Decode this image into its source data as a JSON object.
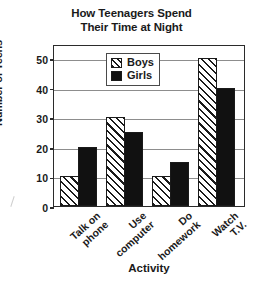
{
  "chart_data": {
    "type": "bar",
    "title": "How Teenagers Spend Their Time at Night",
    "title_lines": [
      "How Teenagers Spend",
      "Their Time at Night"
    ],
    "xlabel": "Activity",
    "ylabel": "Number of Teens",
    "categories": [
      "Talk on phone",
      "Use computer",
      "Do homework",
      "Watch T.V."
    ],
    "category_lines": [
      [
        "Talk on",
        "phone"
      ],
      [
        "Use",
        "computer"
      ],
      [
        "Do",
        "homework"
      ],
      [
        "Watch",
        "T.V."
      ]
    ],
    "series": [
      {
        "name": "Boys",
        "values": [
          10,
          30,
          10,
          50
        ],
        "fill": "diagonal-hatch"
      },
      {
        "name": "Girls",
        "values": [
          20,
          25,
          15,
          40
        ],
        "fill": "solid-black"
      }
    ],
    "ylim": [
      0,
      50
    ],
    "yticks": [
      0,
      10,
      20,
      30,
      40,
      50
    ],
    "ytick_labels": [
      "0",
      "10",
      "20",
      "30",
      "40",
      "50"
    ],
    "grid": true,
    "grid_axis": "y",
    "legend_position": "top-center-inside",
    "colors": {
      "axis": "#2b2b2b",
      "grid": "#8d8d8d",
      "girls_fill": "#111111",
      "boys_fill": "#ffffff",
      "background": "#ffffff"
    }
  }
}
